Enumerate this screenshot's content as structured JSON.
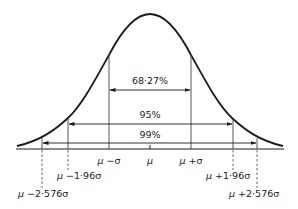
{
  "diagram": {
    "type": "normal-distribution",
    "colors": {
      "line": "#1a1a1a",
      "text": "#222222",
      "background": "#ffffff"
    },
    "intervals": [
      {
        "label": "68·27%",
        "from": "μ −σ",
        "to": "μ +σ"
      },
      {
        "label": "95%",
        "from": "μ −1·96σ",
        "to": "μ +1·96σ"
      },
      {
        "label": "99%",
        "from": "μ −2·576σ",
        "to": "μ +2·576σ"
      }
    ],
    "axis_labels": {
      "minus_sigma": {
        "mu": "μ",
        "rest": " −σ"
      },
      "mean": "μ",
      "plus_sigma": {
        "mu": "μ",
        "rest": " +σ"
      },
      "minus_196": {
        "mu": "μ",
        "rest": " −1·96σ"
      },
      "plus_196": {
        "mu": "μ",
        "rest": " +1·96σ"
      },
      "minus_2576": {
        "mu": "μ",
        "rest": " −2·576σ"
      },
      "plus_2576": {
        "mu": "μ",
        "rest": " +2·576σ"
      }
    }
  }
}
